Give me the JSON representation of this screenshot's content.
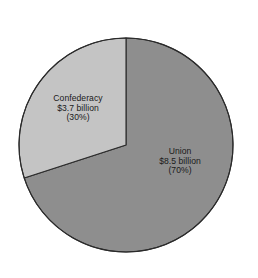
{
  "chart_data": {
    "type": "pie",
    "title": "",
    "subtitle": "",
    "xlabel": "",
    "ylabel": "",
    "grid": false,
    "legend_position": "none",
    "label_placement": "inside-slices",
    "units": "billion US dollars",
    "total_value": 12.2,
    "categories": [
      "Union",
      "Confederacy"
    ],
    "values": [
      8.5,
      3.7
    ],
    "percentages": [
      70,
      30
    ],
    "colors": [
      "#8e8e8e",
      "#c4c4c4"
    ],
    "start_angle_deg": 0,
    "direction": "clockwise",
    "slices": [
      {
        "name": "Union",
        "value": 8.5,
        "percent": 70,
        "color": "#8e8e8e",
        "start_angle_deg": 0,
        "end_angle_deg": 252,
        "label_lines": [
          "Union",
          "$8.5 billion",
          "(70%)"
        ]
      },
      {
        "name": "Confederacy",
        "value": 3.7,
        "percent": 30,
        "color": "#c4c4c4",
        "start_angle_deg": 252,
        "end_angle_deg": 360,
        "label_lines": [
          "Confederacy",
          "$3.7 billion",
          "(30%)"
        ]
      }
    ],
    "annotations": []
  },
  "labels": {
    "confederacy": {
      "line1": "Confederacy",
      "line2": "$3.7 billion",
      "line3": "(30%)"
    },
    "union": {
      "line1": "Union",
      "line2": "$8.5 billion",
      "line3": "(70%)"
    }
  },
  "style": {
    "background": "#ffffff",
    "outline_color": "#2b2b2b",
    "text_color": "#1a1a1a",
    "union_fill": "#8e8e8e",
    "confederacy_fill": "#c4c4c4"
  },
  "geometry": {
    "center_x": 126,
    "center_y": 145,
    "radius": 107
  }
}
